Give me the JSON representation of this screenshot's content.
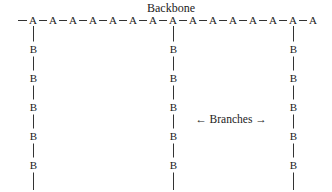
{
  "diagram": {
    "title": "Backbone",
    "title_x": 171,
    "title_y": 2,
    "backbone": {
      "node_label": "A",
      "y": 20,
      "start_x": 18,
      "first_x": 33,
      "spacing": 20,
      "count": 15,
      "nodes": [
        "A",
        "A",
        "A",
        "A",
        "A",
        "A",
        "A",
        "A",
        "A",
        "A",
        "A",
        "A",
        "A",
        "A",
        "A"
      ]
    },
    "branches": [
      {
        "attach_index": 0,
        "x": 33,
        "nodes": [
          "B",
          "B",
          "B",
          "B",
          "B"
        ]
      },
      {
        "attach_index": 7,
        "x": 173,
        "nodes": [
          "B",
          "B",
          "B",
          "B",
          "B"
        ]
      },
      {
        "attach_index": 13,
        "x": 293,
        "nodes": [
          "B",
          "B",
          "B",
          "B",
          "B"
        ]
      }
    ],
    "branch_layout": {
      "first_y": 49,
      "spacing": 29,
      "line_bottom": 190
    },
    "branches_label": {
      "text": "← Branches →",
      "x": 231,
      "y": 119
    },
    "colors": {
      "ink": "#222222",
      "background": "#ffffff"
    }
  }
}
